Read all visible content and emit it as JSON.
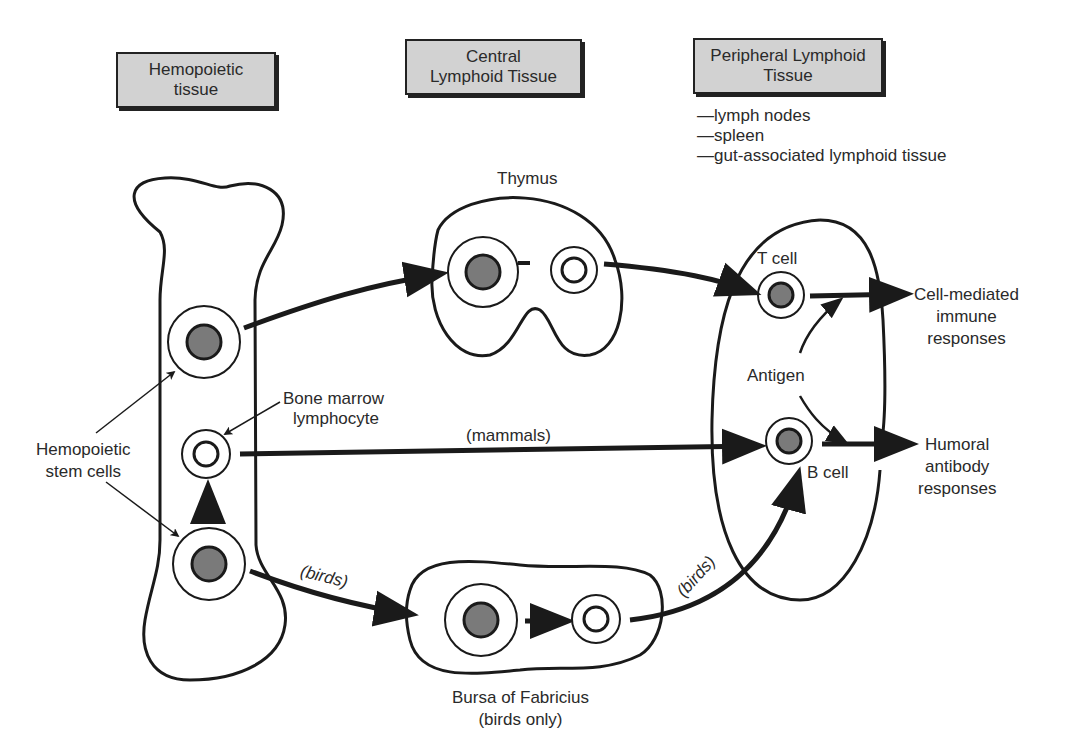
{
  "headers": {
    "hemopoietic": [
      "Hemopoietic",
      "tissue"
    ],
    "central": [
      "Central",
      "Lymphoid Tissue"
    ],
    "peripheral": [
      "Peripheral Lymphoid",
      "Tissue"
    ]
  },
  "peripheral_list": [
    "—lymph nodes",
    "—spleen",
    "—gut-associated lymphoid tissue"
  ],
  "labels": {
    "thymus": "Thymus",
    "t_cell": "T cell",
    "b_cell": "B cell",
    "antigen": "Antigen",
    "bone_marrow_lymphocyte": [
      "Bone marrow",
      "lymphocyte"
    ],
    "hemopoietic_stem_cells": [
      "Hemopoietic",
      "stem cells"
    ],
    "mammals": "(mammals)",
    "birds_left": "(birds)",
    "birds_right": "(birds)",
    "bursa": [
      "Bursa of Fabricius",
      "(birds only)"
    ],
    "cell_mediated": [
      "Cell-mediated",
      "immune",
      "responses"
    ],
    "humoral": [
      "Humoral",
      "antibody",
      "responses"
    ]
  },
  "colors": {
    "nucleus": "#7a7a7a",
    "header_bg": "#d2d2d2",
    "stroke": "#1a1a1a"
  }
}
